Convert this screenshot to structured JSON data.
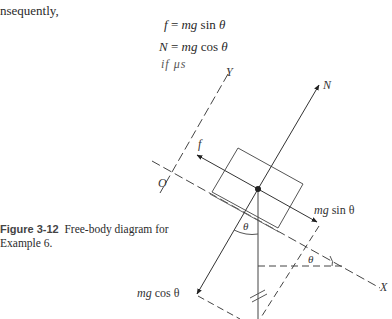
{
  "text": {
    "intro": "nsequently,",
    "equations": [
      {
        "lhs": "f",
        "rhs_var": "mg",
        "rhs_fn": "sin",
        "rhs_angle": "θ",
        "eq": "="
      },
      {
        "lhs": "N",
        "rhs_var": "mg",
        "rhs_fn": "cos",
        "rhs_angle": "θ",
        "eq": "="
      }
    ],
    "handwritten_note": "if μs"
  },
  "figure": {
    "caption_label": "Figure 3-12",
    "caption_text": "Free-body diagram for",
    "caption_text2": "Example 6.",
    "labels": {
      "N": "N",
      "f": "f",
      "Y": "Y",
      "O": "O",
      "X": "X",
      "theta1": "θ",
      "theta2": "θ",
      "mg_sin_var": "mg",
      "mg_sin_rest": "sin θ",
      "mg_cos_var": "mg",
      "mg_cos_rest": "cos θ"
    }
  }
}
